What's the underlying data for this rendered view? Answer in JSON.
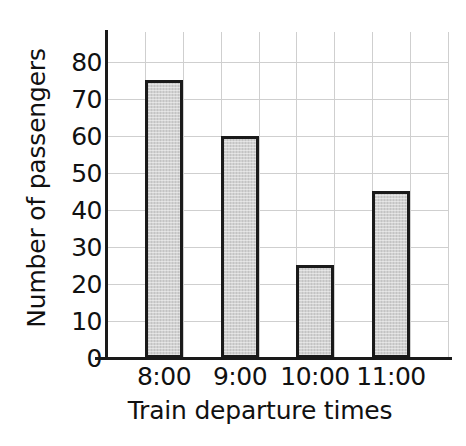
{
  "chart_data": {
    "type": "bar",
    "title": "",
    "xlabel": "Train departure times",
    "ylabel": "Number of passengers",
    "categories": [
      "8:00",
      "9:00",
      "10:00",
      "11:00"
    ],
    "values": [
      75,
      60,
      25,
      45
    ],
    "ylim": [
      0,
      88
    ],
    "yticks": [
      0,
      10,
      20,
      30,
      40,
      50,
      60,
      70,
      80
    ],
    "ytick_labels": [
      "0",
      "10",
      "20",
      "30",
      "40",
      "50",
      "60",
      "70",
      "80"
    ],
    "grid": true,
    "grid_horizontal": true,
    "grid_vertical": true,
    "legend": false,
    "legend_position": "none",
    "colors": {
      "bar_fill": "#d2d2d2",
      "bar_edge": "#1a1a1a",
      "grid": "#cfcfcf",
      "axis": "#1a1a1a",
      "text": "#111111",
      "background": "#ffffff"
    },
    "series": [
      {
        "name": "Number of passengers",
        "values": [
          75,
          60,
          25,
          45
        ]
      }
    ],
    "points": [
      {
        "category": "8:00",
        "value": 75
      },
      {
        "category": "9:00",
        "value": 60
      },
      {
        "category": "10:00",
        "value": 25
      },
      {
        "category": "11:00",
        "value": 45
      }
    ]
  }
}
